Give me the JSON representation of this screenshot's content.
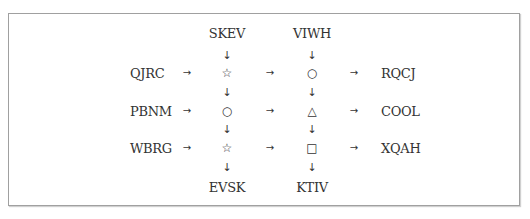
{
  "diagram": {
    "top_labels": [
      "SKEV",
      "VIWH"
    ],
    "bottom_labels": [
      "EVSK",
      "KTIV"
    ],
    "left_labels": [
      "QJRC",
      "PBNM",
      "WBRG"
    ],
    "right_labels": [
      "RQCJ",
      "COOL",
      "XQAH"
    ],
    "grid": [
      [
        "☆",
        "○"
      ],
      [
        "○",
        "△"
      ],
      [
        "☆",
        "□"
      ]
    ],
    "arrows": {
      "right": "→",
      "down": "↓"
    },
    "colors": {
      "text": "#333333",
      "border": "#a0a0a0",
      "background": "#ffffff"
    }
  }
}
